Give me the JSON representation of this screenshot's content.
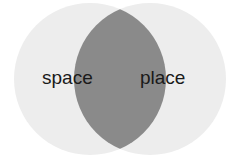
{
  "diagram": {
    "type": "venn",
    "sets": [
      {
        "label": "space",
        "color": "#ededed"
      },
      {
        "label": "place",
        "color": "#ededed"
      }
    ],
    "intersection": {
      "color": "#8a8a8a"
    },
    "background": "#ffffff"
  }
}
